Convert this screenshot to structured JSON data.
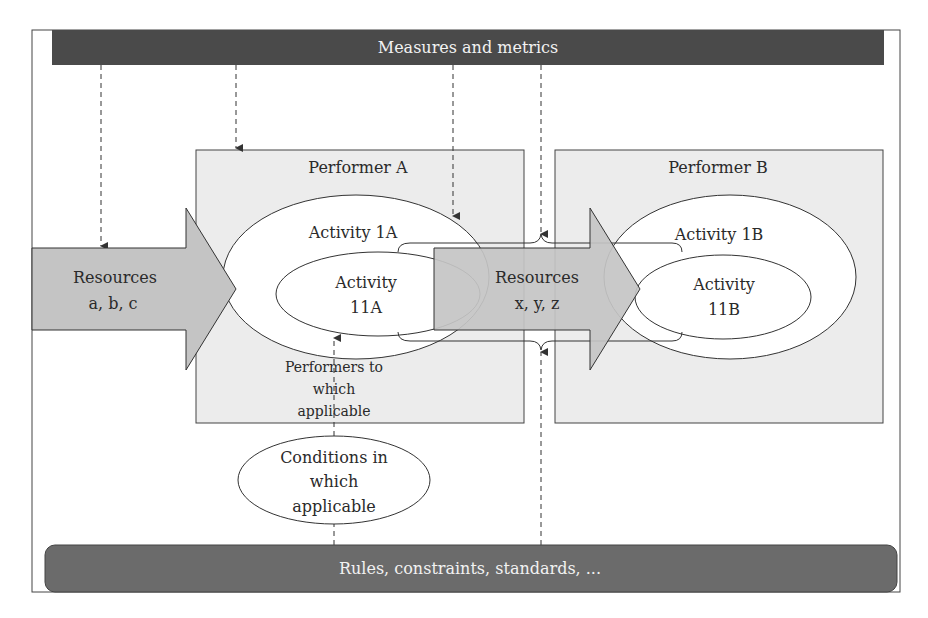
{
  "colors": {
    "bar_fill": "#4a4a4a",
    "bottom_bar_fill": "#6b6b6b",
    "performer_fill": "#ececec",
    "arrow_fill": "#c4c4c4",
    "stroke": "#333333",
    "ellipse_fill": "#ffffff"
  },
  "top_bar": {
    "label": "Measures and metrics"
  },
  "bottom_bar": {
    "label": "Rules, constraints, standards, ..."
  },
  "performers": [
    {
      "label": "Performer A"
    },
    {
      "label": "Performer B"
    }
  ],
  "resources": [
    {
      "line1": "Resources",
      "line2": "a, b, c"
    },
    {
      "line1": "Resources",
      "line2": "x, y, z"
    }
  ],
  "activities": {
    "a_outer": "Activity 1A",
    "a_inner_line1": "Activity",
    "a_inner_line2": "11A",
    "b_outer": "Activity 1B",
    "b_inner_line1": "Activity",
    "b_inner_line2": "11B"
  },
  "performers_note": {
    "line1": "Performers to",
    "line2": "which",
    "line3": "applicable"
  },
  "conditions": {
    "line1": "Conditions in",
    "line2": "which",
    "line3": "applicable"
  }
}
